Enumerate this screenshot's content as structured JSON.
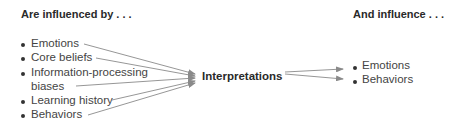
{
  "left": {
    "header": "Are influenced by . . .",
    "items": [
      "Emotions",
      "Core beliefs",
      "Information-processing",
      "biases",
      "Learning history",
      "Behaviors"
    ]
  },
  "center": {
    "label": "Interpretations"
  },
  "right": {
    "header": "And influence . . .",
    "items": [
      "Emotions",
      "Behaviors"
    ]
  },
  "colors": {
    "arrow": "#8a8a8a",
    "text": "#444444",
    "heading": "#2a2a2a"
  }
}
